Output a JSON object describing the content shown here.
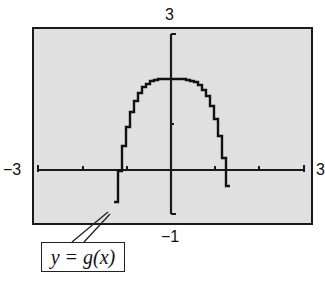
{
  "chart_data": {
    "type": "line",
    "title": "",
    "xlabel": "",
    "ylabel": "",
    "xlim": [
      -3,
      3
    ],
    "ylim": [
      -1,
      3
    ],
    "xscale": 1,
    "yscale": 1,
    "grid": false,
    "window_labels": {
      "xmin": "−3",
      "xmax": "3",
      "ymin": "−1",
      "ymax": "3"
    },
    "series": [
      {
        "name": "y = g(x)",
        "function": "2 - x^4",
        "x": [
          -1.32,
          -1.2,
          -1.0,
          -0.8,
          -0.6,
          -0.4,
          -0.2,
          0,
          0.2,
          0.4,
          0.6,
          0.8,
          1.0,
          1.2,
          1.32
        ],
        "values": [
          -1.0,
          -0.07,
          1.0,
          1.59,
          1.87,
          1.97,
          2.0,
          2.0,
          2.0,
          1.97,
          1.87,
          1.59,
          1.0,
          -0.07,
          -1.0
        ]
      }
    ],
    "annotations": [
      {
        "text": "y = g(x)",
        "points_to": [
          -1.32,
          -1.0
        ]
      }
    ]
  },
  "labels": {
    "ymax": "3",
    "ymin": "−1",
    "xmin": "−3",
    "xmax": "3",
    "callout": "y = g(x)"
  },
  "colors": {
    "screen_bg": "#e0e0e0",
    "ink": "#1a1a1a",
    "page_bg": "#ffffff"
  }
}
